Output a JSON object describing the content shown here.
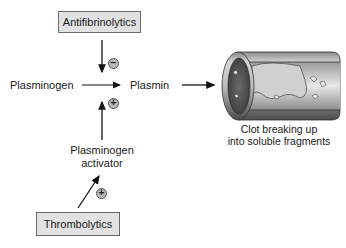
{
  "diagram": {
    "nodes": {
      "antifibrinolytics": "Antifibrinolytics",
      "plasminogen": "Plasminogen",
      "plasmin": "Plasmin",
      "activator_line1": "Plasminogen",
      "activator_line2": "activator",
      "thrombolytics": "Thrombolytics",
      "clot_line1": "Clot breaking up",
      "clot_line2": "into soluble fragments"
    },
    "signs": {
      "inhibit": "−",
      "promote_activator": "+",
      "promote_thrombolytics": "+"
    },
    "edges": [
      {
        "from": "Antifibrinolytics",
        "to": "Plasminogen→Plasmin",
        "effect": "inhibit"
      },
      {
        "from": "Plasminogen",
        "to": "Plasmin",
        "effect": "conversion"
      },
      {
        "from": "Plasminogen activator",
        "to": "Plasminogen→Plasmin",
        "effect": "promote"
      },
      {
        "from": "Thrombolytics",
        "to": "Plasminogen activator",
        "effect": "promote"
      },
      {
        "from": "Plasmin",
        "to": "Clot breaking up into soluble fragments",
        "effect": "leads-to"
      }
    ],
    "colors": {
      "box_fill": "#e2e2e2",
      "box_border": "#6b6b6b",
      "arrow": "#111111",
      "sign_fill": "#b8b8b8"
    }
  }
}
